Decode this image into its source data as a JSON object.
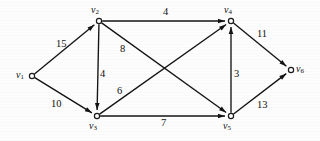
{
  "figure": {
    "type": "directed-weighted-graph",
    "width": 320,
    "height": 141,
    "background_color": "#fdfdfd",
    "stroke_color": "#131313",
    "text_color": "#111111"
  },
  "nodes": [
    {
      "id": "v1",
      "base": "v",
      "sub": "1",
      "x": 32,
      "y": 76,
      "label_x": 16,
      "label_y": 70
    },
    {
      "id": "v2",
      "base": "v",
      "sub": "2",
      "x": 99,
      "y": 21,
      "label_x": 91,
      "label_y": 5
    },
    {
      "id": "v3",
      "base": "v",
      "sub": "3",
      "x": 97,
      "y": 116,
      "label_x": 89,
      "label_y": 121
    },
    {
      "id": "v4",
      "base": "v",
      "sub": "4",
      "x": 231,
      "y": 21,
      "label_x": 224,
      "label_y": 5
    },
    {
      "id": "v5",
      "base": "v",
      "sub": "5",
      "x": 231,
      "y": 116,
      "label_x": 223,
      "label_y": 121
    },
    {
      "id": "v6",
      "base": "v",
      "sub": "6",
      "x": 291,
      "y": 70,
      "label_x": 296,
      "label_y": 64
    }
  ],
  "edges": [
    {
      "id": "e-v1-v2",
      "from": "v1",
      "to": "v2",
      "weight": "15",
      "label_x": 56,
      "label_y": 39
    },
    {
      "id": "e-v1-v3",
      "from": "v1",
      "to": "v3",
      "weight": "10",
      "label_x": 51,
      "label_y": 99
    },
    {
      "id": "e-v2-v3",
      "from": "v2",
      "to": "v3",
      "weight": "4",
      "label_x": 100,
      "label_y": 69
    },
    {
      "id": "e-v2-v4",
      "from": "v2",
      "to": "v4",
      "weight": "4",
      "label_x": 163,
      "label_y": 7
    },
    {
      "id": "e-v2-v5",
      "from": "v2",
      "to": "v5",
      "weight": "8",
      "label_x": 120,
      "label_y": 44
    },
    {
      "id": "e-v3-v4",
      "from": "v3",
      "to": "v4",
      "weight": "6",
      "label_x": 117,
      "label_y": 86
    },
    {
      "id": "e-v3-v5",
      "from": "v3",
      "to": "v5",
      "weight": "7",
      "label_x": 161,
      "label_y": 118
    },
    {
      "id": "e-v5-v4",
      "from": "v5",
      "to": "v4",
      "weight": "3",
      "label_x": 234,
      "label_y": 69
    },
    {
      "id": "e-v4-v6",
      "from": "v4",
      "to": "v6",
      "weight": "11",
      "label_x": 257,
      "label_y": 29
    },
    {
      "id": "e-v5-v6",
      "from": "v5",
      "to": "v6",
      "weight": "13",
      "label_x": 257,
      "label_y": 100
    }
  ]
}
